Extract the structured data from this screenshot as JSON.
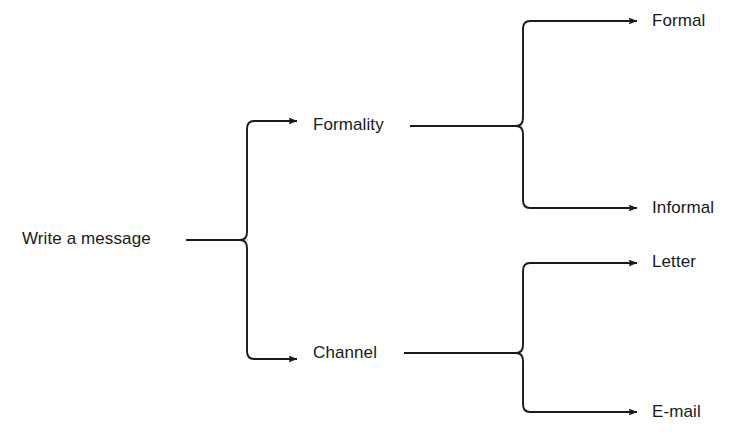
{
  "diagram": {
    "type": "tree-diagram",
    "orientation": "left-to-right",
    "background_color": "#ffffff",
    "line_color": "#1a1a1e",
    "text_color": "#19191c",
    "root": {
      "label": "Write a message",
      "children": [
        {
          "label": "Formality",
          "children": [
            {
              "label": "Formal"
            },
            {
              "label": "Informal"
            }
          ]
        },
        {
          "label": "Channel",
          "children": [
            {
              "label": "Letter"
            },
            {
              "label": "E-mail"
            }
          ]
        }
      ]
    },
    "nodes": {
      "root": "Write a message",
      "branch_1": "Formality",
      "branch_2": "Channel",
      "leaf_1": "Formal",
      "leaf_2": "Informal",
      "leaf_3": "Letter",
      "leaf_4": "E-mail"
    },
    "edges": [
      {
        "from": "Write a message",
        "to": "Formality"
      },
      {
        "from": "Write a message",
        "to": "Channel"
      },
      {
        "from": "Formality",
        "to": "Formal"
      },
      {
        "from": "Formality",
        "to": "Informal"
      },
      {
        "from": "Channel",
        "to": "Letter"
      },
      {
        "from": "Channel",
        "to": "E-mail"
      }
    ]
  }
}
